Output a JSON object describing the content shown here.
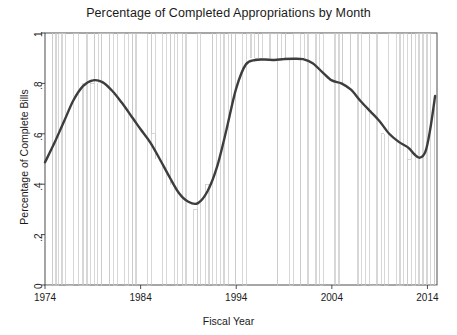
{
  "chart_data": {
    "type": "line",
    "title": "Percentage of Completed Appropriations by Month",
    "xlabel": "Fiscal Year",
    "ylabel": "Percentage of Complete Bills",
    "xlim": [
      1974,
      2015
    ],
    "ylim": [
      0,
      1
    ],
    "grid": false,
    "legend": null,
    "xticks": [
      {
        "value": 1974,
        "label": "1974"
      },
      {
        "value": 1984,
        "label": "1984"
      },
      {
        "value": 1994,
        "label": "1994"
      },
      {
        "value": 2004,
        "label": "2004"
      },
      {
        "value": 2014,
        "label": "2014"
      }
    ],
    "yticks": [
      {
        "value": 0,
        "label": "0"
      },
      {
        "value": 0.2,
        "label": ".2"
      },
      {
        "value": 0.4,
        "label": ".4"
      },
      {
        "value": 0.6,
        "label": ".6"
      },
      {
        "value": 0.8,
        "label": ".8"
      },
      {
        "value": 1,
        "label": "1"
      }
    ],
    "series": [
      {
        "name": "monthly-step",
        "style": "step",
        "color": "#c6c6c6",
        "width": 0.7,
        "x": [
          1974.0,
          1974.3,
          1974.35,
          1974.75,
          1974.8,
          1975.1,
          1975.15,
          1975.45,
          1975.5,
          1975.75,
          1975.8,
          1976.1,
          1976.15,
          1976.5,
          1976.55,
          1976.9,
          1976.95,
          1977.25,
          1977.3,
          1977.55,
          1977.6,
          1977.95,
          1978.0,
          1978.35,
          1978.4,
          1978.75,
          1978.8,
          1979.15,
          1979.2,
          1979.5,
          1979.55,
          1979.9,
          1979.95,
          1980.3,
          1980.35,
          1980.7,
          1980.75,
          1981.1,
          1981.15,
          1981.5,
          1981.55,
          1981.9,
          1981.95,
          1982.3,
          1982.35,
          1982.7,
          1982.75,
          1983.1,
          1983.15,
          1983.5,
          1983.55,
          1983.9,
          1983.95,
          1984.3,
          1984.35,
          1984.7,
          1984.75,
          1985.1,
          1985.15,
          1985.5,
          1985.55,
          1985.9,
          1985.95,
          1986.3,
          1986.35,
          1986.7,
          1986.75,
          1987.1,
          1987.15,
          1987.5,
          1987.55,
          1987.9,
          1987.95,
          1988.3,
          1988.35,
          1988.7,
          1988.75,
          1989.1,
          1989.15,
          1989.5,
          1989.55,
          1989.9,
          1989.95,
          1990.3,
          1990.35,
          1990.7,
          1990.75,
          1991.1,
          1991.15,
          1991.5,
          1991.55,
          1991.9,
          1991.95,
          1992.3,
          1992.35,
          1992.7,
          1992.75,
          1993.1,
          1993.15,
          1993.5,
          1993.55,
          1993.9,
          1993.95,
          1994.3,
          1994.35,
          1994.7,
          1994.75,
          1995.1,
          1995.15,
          1995.5,
          1995.55,
          1995.9,
          1995.95,
          1996.3,
          1996.35,
          1996.7,
          1996.75,
          1997.1,
          1997.15,
          1997.5,
          1997.55,
          1997.9,
          1997.95,
          1998.3,
          1998.35,
          1998.7,
          1998.75,
          1999.1,
          1999.15,
          1999.5,
          1999.55,
          1999.9,
          1999.95,
          2000.3,
          2000.35,
          2000.7,
          2000.75,
          2001.1,
          2001.15,
          2001.5,
          2001.55,
          2001.9,
          2001.95,
          2002.3,
          2002.35,
          2002.7,
          2002.75,
          2003.1,
          2003.15,
          2003.5,
          2003.55,
          2003.9,
          2003.95,
          2004.3,
          2004.35,
          2004.7,
          2004.75,
          2005.1,
          2005.15,
          2005.5,
          2005.55,
          2005.9,
          2005.95,
          2006.3,
          2006.35,
          2006.7,
          2006.75,
          2007.1,
          2007.15,
          2007.5,
          2007.55,
          2007.9,
          2007.95,
          2008.3,
          2008.35,
          2008.7,
          2008.75,
          2009.1,
          2009.15,
          2009.5,
          2009.55,
          2009.9,
          2009.95,
          2010.3,
          2010.35,
          2010.7,
          2010.75,
          2011.1,
          2011.15,
          2011.5,
          2011.55,
          2011.9,
          2011.95,
          2012.3,
          2012.35,
          2012.7,
          2012.75,
          2013.1,
          2013.15,
          2013.5,
          2013.55,
          2013.9,
          2013.95,
          2014.3,
          2014.35,
          2014.7,
          2014.75,
          2015.0
        ],
        "note": "monthly fraction of appropriation bills completed; oscillates between 0 and 1"
      },
      {
        "name": "loess-trend",
        "style": "smooth",
        "color": "#3d3d3d",
        "width": 2.4,
        "points": [
          [
            1974.0,
            0.487
          ],
          [
            1975.0,
            0.565
          ],
          [
            1976.0,
            0.65
          ],
          [
            1977.0,
            0.735
          ],
          [
            1978.0,
            0.79
          ],
          [
            1979.0,
            0.812
          ],
          [
            1980.0,
            0.805
          ],
          [
            1981.0,
            0.772
          ],
          [
            1982.0,
            0.725
          ],
          [
            1983.0,
            0.672
          ],
          [
            1984.0,
            0.618
          ],
          [
            1985.0,
            0.566
          ],
          [
            1986.0,
            0.5
          ],
          [
            1987.0,
            0.43
          ],
          [
            1988.0,
            0.365
          ],
          [
            1989.0,
            0.33
          ],
          [
            1990.0,
            0.325
          ],
          [
            1991.0,
            0.372
          ],
          [
            1992.0,
            0.47
          ],
          [
            1993.0,
            0.62
          ],
          [
            1994.0,
            0.78
          ],
          [
            1995.0,
            0.875
          ],
          [
            1996.0,
            0.893
          ],
          [
            1997.0,
            0.895
          ],
          [
            1998.0,
            0.893
          ],
          [
            1999.0,
            0.897
          ],
          [
            2000.0,
            0.898
          ],
          [
            2001.0,
            0.896
          ],
          [
            2002.0,
            0.88
          ],
          [
            2003.0,
            0.845
          ],
          [
            2004.0,
            0.812
          ],
          [
            2005.0,
            0.8
          ],
          [
            2006.0,
            0.775
          ],
          [
            2007.0,
            0.73
          ],
          [
            2008.0,
            0.69
          ],
          [
            2009.0,
            0.65
          ],
          [
            2010.0,
            0.6
          ],
          [
            2011.0,
            0.568
          ],
          [
            2012.0,
            0.545
          ],
          [
            2012.6,
            0.52
          ],
          [
            2013.2,
            0.505
          ],
          [
            2013.8,
            0.53
          ],
          [
            2014.3,
            0.62
          ],
          [
            2014.8,
            0.75
          ]
        ]
      }
    ]
  }
}
